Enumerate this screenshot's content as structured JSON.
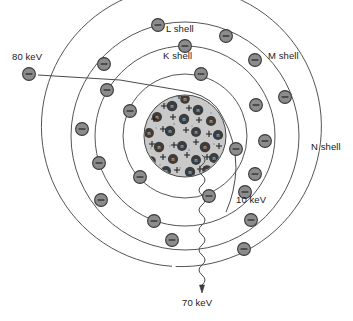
{
  "diagram": {
    "background_color": "#ffffff",
    "shell_stroke_color": "#555555",
    "electron_fill_color": "#8c8c8c",
    "electron_stroke_color": "#3a3a3a",
    "nucleus_fill_color": "#c9c9c9",
    "neutron_color": "#3c3c3c",
    "center": {
      "x": 185,
      "y": 136
    }
  },
  "labels": {
    "k_shell": "K shell",
    "l_shell": "L shell",
    "m_shell": "M shell",
    "n_shell": "N shell",
    "incident_energy": "80 keV",
    "scattered_energy": "10 keV",
    "photon_energy": "70 keV"
  },
  "label_positions": {
    "k_shell": {
      "x": 163,
      "y": 57
    },
    "l_shell": {
      "x": 166,
      "y": 30
    },
    "m_shell": {
      "x": 268,
      "y": 57
    },
    "n_shell": {
      "x": 311,
      "y": 148
    },
    "incident_energy": {
      "x": 12,
      "y": 58
    },
    "scattered_energy": {
      "x": 236,
      "y": 200
    },
    "photon_energy": {
      "x": 194,
      "y": 302
    }
  },
  "shells": [
    {
      "name": "K shell",
      "radius": 62,
      "type": "circle",
      "electron_count": 5
    },
    {
      "name": "L shell",
      "radius": 90,
      "type": "circle",
      "electron_count": 6
    },
    {
      "name": "M shell",
      "radius": 114,
      "type": "circle",
      "electron_count": 7
    },
    {
      "name": "N shell",
      "radius": 140,
      "type": "open-arc",
      "electron_count": 0
    }
  ],
  "electrons": [
    {
      "shell": "K",
      "x": 201,
      "y": 74,
      "angle_deg": -77
    },
    {
      "shell": "K",
      "x": 130,
      "y": 111,
      "angle_deg": 204
    },
    {
      "shell": "K",
      "x": 140,
      "y": 177,
      "angle_deg": 138
    },
    {
      "shell": "K",
      "x": 209,
      "y": 196,
      "angle_deg": 67
    },
    {
      "shell": "K",
      "x": 236,
      "y": 149,
      "angle_deg": 14
    },
    {
      "shell": "L",
      "x": 185,
      "y": 46,
      "angle_deg": -90
    },
    {
      "shell": "L",
      "x": 107,
      "y": 90,
      "angle_deg": 210
    },
    {
      "shell": "L",
      "x": 99,
      "y": 163,
      "angle_deg": 160
    },
    {
      "shell": "L",
      "x": 154,
      "y": 221,
      "angle_deg": 107
    },
    {
      "shell": "L",
      "x": 245,
      "y": 192,
      "angle_deg": 51
    },
    {
      "shell": "L",
      "x": 256,
      "y": 105,
      "angle_deg": -20
    },
    {
      "shell": "M",
      "x": 158,
      "y": 25,
      "angle_deg": -103
    },
    {
      "shell": "M",
      "x": 226,
      "y": 36,
      "angle_deg": -63
    },
    {
      "shell": "M",
      "x": 104,
      "y": 64,
      "angle_deg": 221
    },
    {
      "shell": "M",
      "x": 82,
      "y": 129,
      "angle_deg": 182
    },
    {
      "shell": "M",
      "x": 101,
      "y": 200,
      "angle_deg": 146
    },
    {
      "shell": "M",
      "x": 172,
      "y": 240,
      "angle_deg": 96
    },
    {
      "shell": "M",
      "x": 244,
      "y": 249,
      "angle_deg": 62
    },
    {
      "shell": "M",
      "x": 251,
      "y": 220,
      "angle_deg": 48
    },
    {
      "shell": "M",
      "x": 265,
      "y": 141,
      "angle_deg": 4
    },
    {
      "shell": "M",
      "x": 255,
      "y": 60,
      "angle_deg": -44
    },
    {
      "shell": "free",
      "x": 29,
      "y": 74,
      "angle_deg": 0
    }
  ],
  "trajectories": {
    "incident": {
      "label": "80 keV",
      "description": "incident electron travelling right, deflected at nucleus"
    },
    "scattered": {
      "label": "10 keV",
      "description": "scattered electron leaving down-right"
    },
    "photon": {
      "label": "70 keV",
      "description": "emitted photon shown as wavy line with arrowhead pointing down"
    }
  }
}
